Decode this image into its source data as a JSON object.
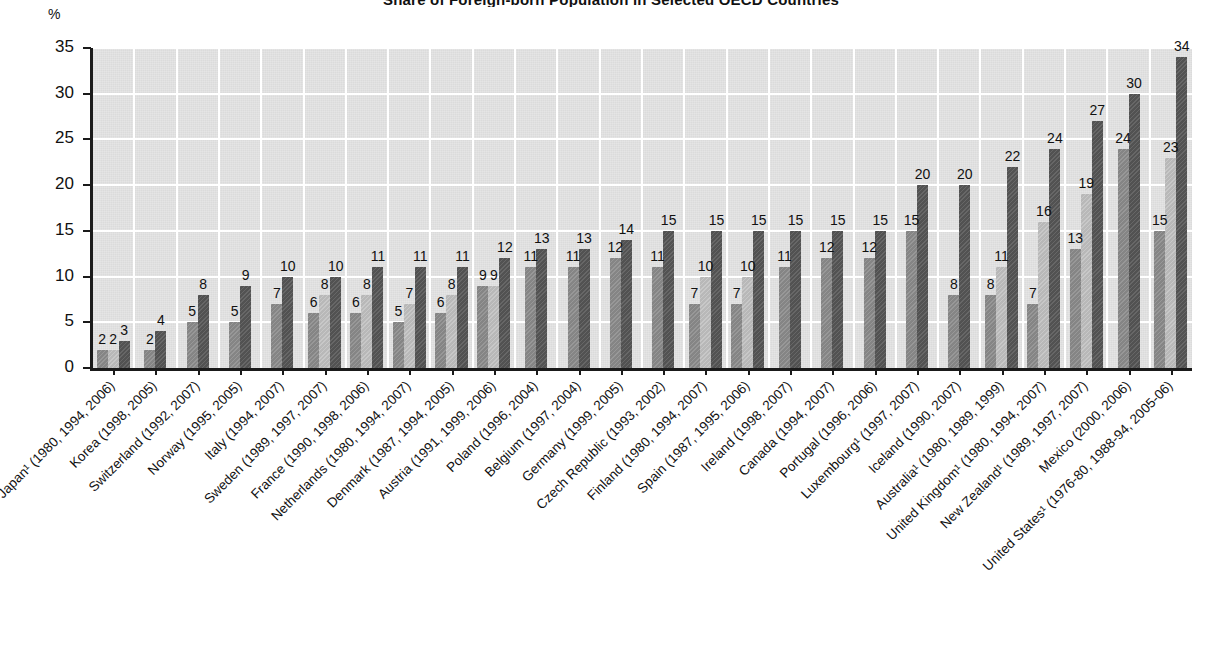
{
  "chart_title": "Share of Foreign-born Population in Selected OECD Countries",
  "y_axis_unit": "%",
  "chart_data": {
    "type": "bar",
    "title": "Share of Foreign-born Population in Selected OECD Countries",
    "xlabel": "",
    "ylabel": "%",
    "ylim": [
      0,
      35
    ],
    "yticks": [
      0,
      5,
      10,
      15,
      20,
      25,
      30,
      35
    ],
    "grid": true,
    "legend": "none",
    "series_colors": [
      "#8c8c8c",
      "#c2c2c2",
      "#565656"
    ],
    "categories": [
      "Japan¹ (1980, 1994, 2006)",
      "Korea (1998, 2005)",
      "Switzerland (1992, 2007)",
      "Norway (1995, 2005)",
      "Italy (1994, 2007)",
      "Sweden (1989, 1997, 2007)",
      "France (1990, 1998, 2006)",
      "Netherlands (1980, 1994, 2007)",
      "Denmark (1987, 1994, 2005)",
      "Austria (1991, 1999, 2006)",
      "Poland (1996, 2004)",
      "Belgium (1997, 2004)",
      "Germany (1999, 2005)",
      "Czech Republic (1993, 2002)",
      "Finland (1980, 1994, 2007)",
      "Spain (1987, 1995, 2006)",
      "Ireland (1998, 2007)",
      "Canada (1994, 2007)",
      "Portugal (1996, 2006)",
      "Luxembourg¹ (1997, 2007)",
      "Iceland (1990, 2007)",
      "Australia¹ (1980, 1989, 1999)",
      "United Kingdom¹ (1980, 1994, 2007)",
      "New Zealand¹ (1989, 1997, 2007)",
      "Mexico (2000, 2006)",
      "United States¹ (1976-80, 1988-94, 2005-06)"
    ],
    "groups": [
      {
        "category": "Japan¹ (1980, 1994, 2006)",
        "values": [
          2,
          2,
          3
        ]
      },
      {
        "category": "Korea (1998, 2005)",
        "values": [
          2,
          4
        ]
      },
      {
        "category": "Switzerland (1992, 2007)",
        "values": [
          5,
          8
        ]
      },
      {
        "category": "Norway (1995, 2005)",
        "values": [
          5,
          9
        ]
      },
      {
        "category": "Italy (1994, 2007)",
        "values": [
          7,
          10
        ]
      },
      {
        "category": "Sweden (1989, 1997, 2007)",
        "values": [
          6,
          8,
          10
        ]
      },
      {
        "category": "France (1990, 1998, 2006)",
        "values": [
          6,
          8,
          11
        ]
      },
      {
        "category": "Netherlands (1980, 1994, 2007)",
        "values": [
          5,
          7,
          11
        ]
      },
      {
        "category": "Denmark (1987, 1994, 2005)",
        "values": [
          6,
          8,
          11
        ]
      },
      {
        "category": "Austria (1991, 1999, 2006)",
        "values": [
          9,
          9,
          12
        ]
      },
      {
        "category": "Poland (1996, 2004)",
        "values": [
          11,
          13
        ]
      },
      {
        "category": "Belgium (1997, 2004)",
        "values": [
          11,
          13
        ]
      },
      {
        "category": "Germany (1999, 2005)",
        "values": [
          12,
          14
        ]
      },
      {
        "category": "Czech Republic (1993, 2002)",
        "values": [
          11,
          15
        ]
      },
      {
        "category": "Finland (1980, 1994, 2007)",
        "values": [
          7,
          10,
          15
        ]
      },
      {
        "category": "Spain (1987, 1995, 2006)",
        "values": [
          7,
          10,
          15
        ]
      },
      {
        "category": "Ireland (1998, 2007)",
        "values": [
          11,
          15
        ]
      },
      {
        "category": "Canada (1994, 2007)",
        "values": [
          12,
          15
        ]
      },
      {
        "category": "Portugal (1996, 2006)",
        "values": [
          12,
          15
        ]
      },
      {
        "category": "Luxembourg¹ (1997, 2007)",
        "values": [
          15,
          20
        ]
      },
      {
        "category": "Iceland (1990, 2007)",
        "values": [
          8,
          20
        ]
      },
      {
        "category": "Australia¹ (1980, 1989, 1999)",
        "values": [
          8,
          11,
          22
        ]
      },
      {
        "category": "United Kingdom¹ (1980, 1994, 2007)",
        "values": [
          7,
          16,
          24
        ]
      },
      {
        "category": "New Zealand¹ (1989, 1997, 2007)",
        "values": [
          13,
          19,
          27
        ]
      },
      {
        "category": "Mexico (2000, 2006)",
        "values": [
          24,
          30
        ]
      },
      {
        "category": "United States¹ (1976-80, 1988-94, 2005-06)",
        "values": [
          15,
          23,
          34
        ]
      }
    ]
  }
}
